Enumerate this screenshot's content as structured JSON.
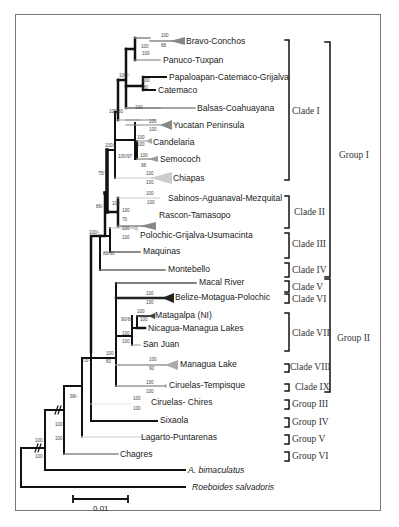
{
  "figure": {
    "type": "phylogenetic-tree",
    "scale_bar": {
      "label": "0.01"
    }
  },
  "taxa": [
    {
      "name": "Bravo-Conchos",
      "shade": "#888888",
      "collapsed": true
    },
    {
      "name": "Panuco-Tuxpan",
      "shade": "#888888",
      "collapsed": false
    },
    {
      "name": "Papaloapan-Catemaco-Grijalva",
      "shade": "#111111",
      "collapsed": false
    },
    {
      "name": "Catemaco",
      "shade": "#111111",
      "collapsed": false
    },
    {
      "name": "Balsas-Coahuayana",
      "shade": "#888888",
      "collapsed": false
    },
    {
      "name": "Yucatan Peninsula",
      "shade": "#888888",
      "collapsed": true
    },
    {
      "name": "Candelaria",
      "shade": "#aaaaaa",
      "collapsed": true
    },
    {
      "name": "Semococh",
      "shade": "#999999",
      "collapsed": true
    },
    {
      "name": "Chiapas",
      "shade": "#cccccc",
      "collapsed": true
    },
    {
      "name": "Sabinos-Aguanaval-Mezquital",
      "shade": "#cccccc",
      "collapsed": true
    },
    {
      "name": "Rascon-Tamasopo",
      "shade": "#888888",
      "collapsed": true
    },
    {
      "name": "Polochic-Grijalva-Usumacinta",
      "shade": "#cccccc",
      "collapsed": true
    },
    {
      "name": "Maquinas",
      "shade": "#666666",
      "collapsed": false
    },
    {
      "name": "Montebello",
      "shade": "#666666",
      "collapsed": false
    },
    {
      "name": "Macal River",
      "shade": "#555555",
      "collapsed": false
    },
    {
      "name": "Belize-Motagua-Polochic",
      "shade": "#333333",
      "collapsed": true
    },
    {
      "name": "Matagalpa (NI)",
      "shade": "#444444",
      "collapsed": true
    },
    {
      "name": "Nicagua-Managua Lakes",
      "shade": "#111111",
      "collapsed": false
    },
    {
      "name": "San Juan",
      "shade": "#aaaaaa",
      "collapsed": false
    },
    {
      "name": "Managua Lake",
      "shade": "#999999",
      "collapsed": true
    },
    {
      "name": "Ciruelas-Tempisque",
      "shade": "#999999",
      "collapsed": true
    },
    {
      "name": "Ciruelas- Chires",
      "shade": "#dddddd",
      "collapsed": false
    },
    {
      "name": "Sixaola",
      "shade": "#111111",
      "collapsed": false
    },
    {
      "name": "Lagarto-Puntarenas",
      "shade": "#dddddd",
      "collapsed": false
    },
    {
      "name": "Chagres",
      "shade": "#888888",
      "collapsed": false
    },
    {
      "name": "A. bimaculatus",
      "shade": "#111111",
      "collapsed": false,
      "italic": true
    },
    {
      "name": "Roeboides salvadoris",
      "shade": "#111111",
      "collapsed": false,
      "italic": true
    }
  ],
  "bootstrap": {
    "bravo_top": "100",
    "bravo_bot": "88",
    "bravo_panuco_top": "100",
    "bravo_panuco_bot": "100",
    "upper1": "100/-",
    "papaloapan_top": "100",
    "papaloapan_bot": "80",
    "balsas": "100",
    "upper2": "100/80",
    "yucatan_top": "100",
    "yucatan_bot": "100",
    "candelaria_top": "100",
    "candelaria_bot": "100",
    "candelaria_semococh": "100/97",
    "semococh_top": "100",
    "semococh_bot": "98",
    "clade1_node": "100/-",
    "chiapas_top": "100",
    "chiapas_bot": "100",
    "node75": "75/-",
    "sabinos_top": "100",
    "sabinos_bot": "100",
    "clade2_node": "100",
    "rascon_top": "100",
    "rascon_bot": "70",
    "node86": "86/-",
    "polochic_top": "100",
    "polochic_bot": "100",
    "maquinas_node": "88/60",
    "group1_node": "100/-",
    "belize_top": "100",
    "belize_bot": "100",
    "matagalpa_top": "100",
    "matagalpa_bot": "100",
    "matagalpa_nic": "90/60",
    "clade7_top": "100",
    "clade7_bot": "100",
    "group2_top": "100",
    "group2_bot": "60",
    "managua_top": "100",
    "managua_bot": "90",
    "node73": "73/-",
    "ciruelas_t_top": "100",
    "ciruelas_t_bot": "100",
    "ciruelas_c_top": "100",
    "ciruelas_c_bot": "100",
    "node99": "99/-",
    "node_break1_top": "100",
    "node_break1_bot": "100",
    "root_top": "100",
    "root_bot": "100"
  },
  "clades": [
    {
      "label": "Clade I"
    },
    {
      "label": "Clade II"
    },
    {
      "label": "Clade III"
    },
    {
      "label": "Clade IV"
    },
    {
      "label": "Clade V"
    },
    {
      "label": "Clade VI"
    },
    {
      "label": "Clade VII"
    },
    {
      "label": "Clade VIII"
    },
    {
      "label": "Clade IX"
    }
  ],
  "groups": [
    {
      "label": "Group I"
    },
    {
      "label": "Group II"
    },
    {
      "label": "Group III"
    },
    {
      "label": "Group IV"
    },
    {
      "label": "Group V"
    },
    {
      "label": "Group VI"
    }
  ]
}
